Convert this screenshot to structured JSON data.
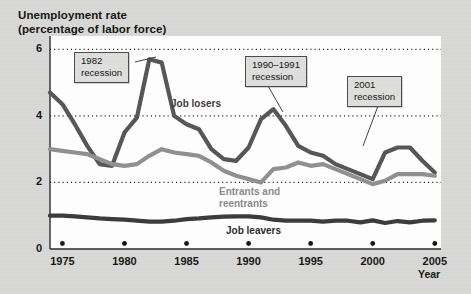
{
  "figure": {
    "title_line1": "Unemployment rate",
    "title_line2": "(percentage of labor force)",
    "background_color": "#d8d8d6",
    "plot_background_color": "#ffffff"
  },
  "annotations": [
    {
      "name": "recession-1982",
      "line1": "1982",
      "line2": "recession",
      "x": 74,
      "y": 52
    },
    {
      "name": "recession-1990-1991",
      "line1": "1990–1991",
      "line2": "recession",
      "x": 245,
      "y": 56
    },
    {
      "name": "recession-2001",
      "line1": "2001",
      "line2": "recession",
      "x": 347,
      "y": 76
    }
  ],
  "series_labels": [
    {
      "name": "job-losers-label",
      "text": "Job losers",
      "x": 171,
      "y": 98,
      "color": "#3b3b3b"
    },
    {
      "name": "entrants-label",
      "text": "Entrants and\nreentrants",
      "x": 219,
      "y": 186,
      "color": "#8a8a8a"
    },
    {
      "name": "job-leavers-label",
      "text": "Job leavers",
      "x": 226,
      "y": 225,
      "color": "#2b2b2b"
    }
  ],
  "chart_data": {
    "type": "line",
    "title": "Unemployment rate (percentage of labor force)",
    "xlabel": "Year",
    "ylabel": "Unemployment rate (percentage of labor force)",
    "xlim": [
      1974,
      2005.5
    ],
    "ylim": [
      0,
      6.4
    ],
    "ytick_labels": [
      "0",
      "2",
      "4",
      "6"
    ],
    "yticks": [
      0,
      2,
      4,
      6
    ],
    "xtick_labels": [
      "1975",
      "1980",
      "1985",
      "1990",
      "1995",
      "2000",
      "2005"
    ],
    "xticks": [
      1975,
      1980,
      1985,
      1990,
      1995,
      2000,
      2005
    ],
    "grid": "horizontal-dotted",
    "legend": "inline-labels",
    "x": [
      1974,
      1975,
      1976,
      1977,
      1978,
      1979,
      1980,
      1981,
      1982,
      1983,
      1984,
      1985,
      1986,
      1987,
      1988,
      1989,
      1990,
      1991,
      1992,
      1993,
      1994,
      1995,
      1996,
      1997,
      1998,
      1999,
      2000,
      2001,
      2002,
      2003,
      2004,
      2005
    ],
    "series": [
      {
        "name": "Job losers",
        "color": "#555555",
        "width": 4.2,
        "values": [
          4.7,
          4.35,
          3.75,
          3.1,
          2.55,
          2.5,
          3.5,
          3.95,
          5.7,
          5.6,
          4.0,
          3.75,
          3.6,
          3.0,
          2.7,
          2.65,
          3.05,
          3.9,
          4.2,
          3.7,
          3.1,
          2.9,
          2.8,
          2.55,
          2.4,
          2.25,
          2.1,
          2.9,
          3.05,
          3.05,
          2.65,
          2.3
        ]
      },
      {
        "name": "Entrants and reentrants",
        "color": "#909090",
        "width": 4.2,
        "values": [
          3.0,
          2.95,
          2.9,
          2.85,
          2.7,
          2.55,
          2.5,
          2.55,
          2.8,
          3.0,
          2.9,
          2.85,
          2.8,
          2.6,
          2.35,
          2.2,
          2.1,
          2.0,
          2.4,
          2.45,
          2.6,
          2.5,
          2.55,
          2.4,
          2.25,
          2.1,
          1.95,
          2.05,
          2.25,
          2.25,
          2.25,
          2.2
        ]
      },
      {
        "name": "Job leavers",
        "color": "#3a3a3a",
        "width": 4.2,
        "values": [
          1.0,
          1.0,
          0.98,
          0.95,
          0.92,
          0.9,
          0.88,
          0.85,
          0.82,
          0.82,
          0.85,
          0.9,
          0.92,
          0.95,
          0.97,
          0.98,
          0.98,
          0.95,
          0.88,
          0.85,
          0.85,
          0.85,
          0.82,
          0.85,
          0.85,
          0.8,
          0.86,
          0.78,
          0.84,
          0.8,
          0.85,
          0.86
        ]
      }
    ]
  }
}
